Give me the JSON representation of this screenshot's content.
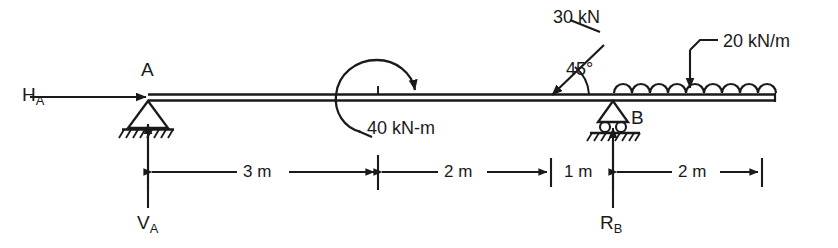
{
  "diagram": {
    "type": "beam-loading-diagram",
    "line_color": "#1a1a1a",
    "background": "#ffffff"
  },
  "supports": [
    {
      "id": "A",
      "label": "A",
      "kind": "pin-support",
      "x_m": 0
    },
    {
      "id": "B",
      "label": "B",
      "kind": "roller-support",
      "x_m": 6
    }
  ],
  "reactions": [
    {
      "name": "horizontal-reaction-a",
      "base": "H",
      "subscript": "A",
      "direction": "right"
    },
    {
      "name": "vertical-reaction-a",
      "base": "V",
      "subscript": "A",
      "direction": "up"
    },
    {
      "name": "vertical-reaction-b",
      "base": "R",
      "subscript": "B",
      "direction": "up"
    }
  ],
  "loads": {
    "moment": {
      "label": "40 kN-m",
      "magnitude": 40,
      "unit": "kN-m",
      "sense": "clockwise",
      "x_m": 3
    },
    "point_load": {
      "label": "30 kN",
      "magnitude": 30,
      "unit": "kN",
      "angle_label": "45°",
      "angle_deg": 45,
      "x_m": 5
    },
    "distributed_load": {
      "label": "20 kN/m",
      "magnitude": 20,
      "unit": "kN/m",
      "from_m": 6,
      "to_m": 8,
      "shape": "uniform"
    }
  },
  "dimensions": [
    {
      "label": "3 m",
      "value": 3,
      "unit": "m",
      "from_m": 0,
      "to_m": 3
    },
    {
      "label": "2 m",
      "value": 2,
      "unit": "m",
      "from_m": 3,
      "to_m": 5
    },
    {
      "label": "1 m",
      "value": 1,
      "unit": "m",
      "from_m": 5,
      "to_m": 6
    },
    {
      "label": "2 m",
      "value": 2,
      "unit": "m",
      "from_m": 6,
      "to_m": 8
    }
  ]
}
